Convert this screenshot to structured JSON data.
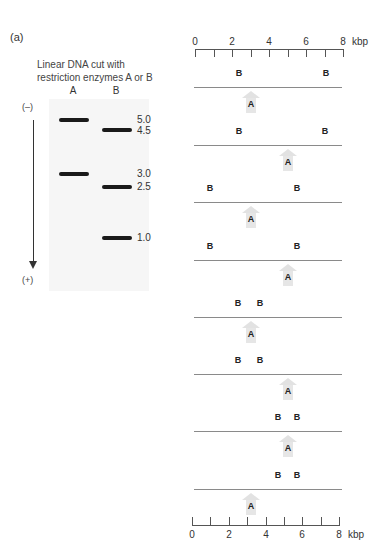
{
  "panel_label": "(a)",
  "gel": {
    "title_line1": "Linear DNA cut with",
    "title_line2": "restriction enzymes A or B",
    "lanes": [
      {
        "label": "A",
        "bands_kbp": [
          5.0,
          3.0
        ]
      },
      {
        "label": "B",
        "bands_kbp": [
          4.5,
          2.5,
          1.0
        ]
      }
    ],
    "band_labels": [
      "5.0",
      "4.5",
      "3.0",
      "2.5",
      "1.0"
    ],
    "negative_pole": "(–)",
    "positive_pole": "(+)"
  },
  "ruler": {
    "ticks": [
      "0",
      "2",
      "4",
      "6",
      "8"
    ],
    "unit": "kbp",
    "min": 0,
    "max": 8
  },
  "maps": [
    {
      "b_sites_kbp": [
        2.4,
        7.1
      ],
      "a_site_kbp": 3.0,
      "b_label": "B",
      "a_label": "A"
    },
    {
      "b_sites_kbp": [
        2.4,
        7.0
      ],
      "a_site_kbp": 5.0,
      "b_label": "B",
      "a_label": "A"
    },
    {
      "b_sites_kbp": [
        0.8,
        5.5
      ],
      "a_site_kbp": 3.0,
      "b_label": "B",
      "a_label": "A"
    },
    {
      "b_sites_kbp": [
        0.8,
        5.5
      ],
      "a_site_kbp": 5.0,
      "b_label": "B",
      "a_label": "A"
    },
    {
      "b_sites_kbp": [
        2.3,
        3.5
      ],
      "a_site_kbp": 3.0,
      "b_label": "B",
      "a_label": "A"
    },
    {
      "b_sites_kbp": [
        2.3,
        3.5
      ],
      "a_site_kbp": 5.0,
      "b_label": "B",
      "a_label": "A"
    },
    {
      "b_sites_kbp": [
        4.5,
        5.5
      ],
      "a_site_kbp": 5.0,
      "b_label": "B",
      "a_label": "A"
    },
    {
      "b_sites_kbp": [
        4.5,
        5.5
      ],
      "a_site_kbp": 3.0,
      "b_label": "B",
      "a_label": "A"
    }
  ]
}
